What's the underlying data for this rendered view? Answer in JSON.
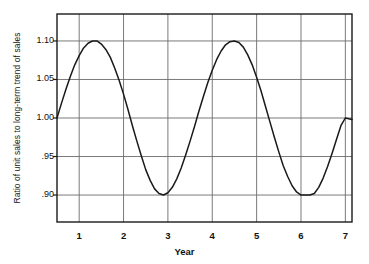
{
  "chart_data": {
    "type": "line",
    "title": "",
    "xlabel": "Year",
    "ylabel": "Ratio of unit sales to long-term trend of sales",
    "xlim": [
      0.5,
      7.15
    ],
    "ylim": [
      0.865,
      1.135
    ],
    "xticks": [
      "1",
      "2",
      "3",
      "4",
      "5",
      "6",
      "7"
    ],
    "xtick_values": [
      1,
      2,
      3,
      4,
      5,
      6,
      7
    ],
    "yticks": [
      "1.10",
      "1.05",
      "1.00",
      ".95",
      ".90"
    ],
    "ytick_values": [
      1.1,
      1.05,
      1.0,
      0.95,
      0.9
    ],
    "grid": true,
    "grid_color": "#6b6b6b",
    "frame_color": "#1a1a1a",
    "line_color": "#1a1a1a",
    "legend": "none",
    "series": [
      {
        "name": "Seasonal ratio of unit sales",
        "description": "Sinusoidal seasonal index, amplitude 0.10 about 1.00, period about 3.2 years",
        "x": [
          0.5,
          0.6,
          0.7,
          0.8,
          0.9,
          1.0,
          1.1,
          1.2,
          1.3,
          1.4,
          1.5,
          1.6,
          1.7,
          1.8,
          1.9,
          2.0,
          2.1,
          2.2,
          2.3,
          2.4,
          2.5,
          2.6,
          2.7,
          2.8,
          2.9,
          3.0,
          3.1,
          3.2,
          3.3,
          3.4,
          3.5,
          3.6,
          3.7,
          3.8,
          3.9,
          4.0,
          4.1,
          4.2,
          4.3,
          4.4,
          4.5,
          4.6,
          4.7,
          4.8,
          4.9,
          5.0,
          5.1,
          5.2,
          5.3,
          5.4,
          5.5,
          5.6,
          5.7,
          5.8,
          5.9,
          6.0,
          6.1,
          6.2,
          6.3,
          6.4,
          6.5,
          6.6,
          6.7,
          6.8,
          6.9,
          7.0,
          7.15
        ],
        "y": [
          1.0,
          1.019,
          1.037,
          1.054,
          1.069,
          1.081,
          1.091,
          1.097,
          1.1,
          1.1,
          1.096,
          1.089,
          1.079,
          1.065,
          1.049,
          1.031,
          1.011,
          0.99,
          0.97,
          0.951,
          0.933,
          0.919,
          0.908,
          0.902,
          0.9,
          0.903,
          0.91,
          0.921,
          0.935,
          0.952,
          0.97,
          0.989,
          1.009,
          1.028,
          1.046,
          1.062,
          1.076,
          1.087,
          1.095,
          1.099,
          1.1,
          1.098,
          1.092,
          1.082,
          1.069,
          1.053,
          1.035,
          1.015,
          0.995,
          0.975,
          0.956,
          0.938,
          0.924,
          0.912,
          0.904,
          0.9,
          0.9,
          0.9,
          0.902,
          0.91,
          0.922,
          0.937,
          0.954,
          0.972,
          0.99,
          1.0,
          0.998
        ],
        "peaks": [
          {
            "x": 1.35,
            "y": 1.1
          },
          {
            "x": 4.55,
            "y": 1.1
          }
        ],
        "troughs": [
          {
            "x": 2.9,
            "y": 0.9
          },
          {
            "x": 6.2,
            "y": 0.9
          }
        ],
        "start_point": {
          "x": 0.5,
          "y": 1.0
        },
        "end_point": {
          "x": 7.15,
          "y": 1.0
        }
      }
    ]
  },
  "figure": {
    "plot_area": {
      "left": 57,
      "top": 14,
      "right": 352,
      "bottom": 222
    }
  }
}
